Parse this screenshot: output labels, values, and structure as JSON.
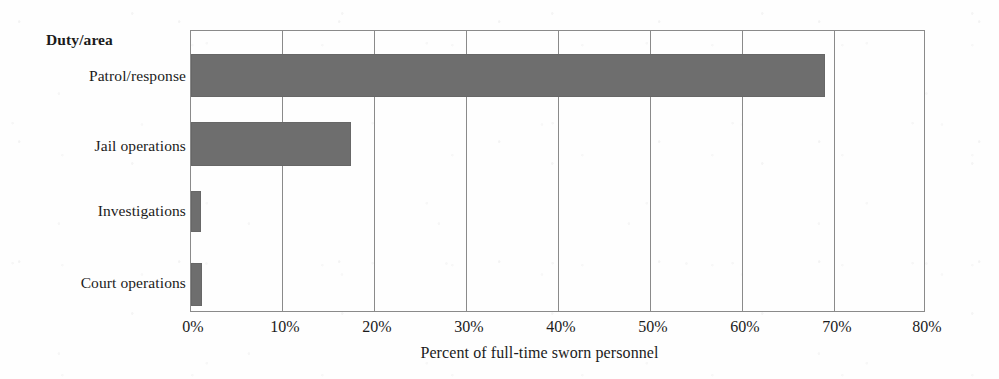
{
  "chart_data": {
    "type": "bar",
    "orientation": "horizontal",
    "title": "",
    "category_axis_label": "Duty/area",
    "xlabel": "Percent of full-time sworn personnel",
    "ylabel": "",
    "categories": [
      "Patrol/response",
      "Jail operations",
      "Investigations",
      "Court operations"
    ],
    "values": [
      69.0,
      17.4,
      1.1,
      1.2
    ],
    "value_suffix": "%",
    "xlim": [
      0,
      80
    ],
    "xticks": [
      0,
      10,
      20,
      30,
      40,
      50,
      60,
      70,
      80
    ],
    "xtick_labels": [
      "0%",
      "10%",
      "20%",
      "30%",
      "40%",
      "50%",
      "60%",
      "70%",
      "80%"
    ],
    "grid": "vertical",
    "legend": "none",
    "bar_color": "#6e6e6e",
    "axis_color": "#8a8a8a",
    "background_color": "#fefefe"
  },
  "chart": {
    "axis_header": "Duty/area",
    "x_title": "Percent of full-time sworn personnel",
    "bars": [
      {
        "label": "Patrol/response",
        "value": 69.0
      },
      {
        "label": "Jail operations",
        "value": 17.4
      },
      {
        "label": "Investigations",
        "value": 1.1
      },
      {
        "label": "Court operations",
        "value": 1.2
      }
    ],
    "ticks": [
      {
        "label": "0%",
        "value": 0
      },
      {
        "label": "10%",
        "value": 10
      },
      {
        "label": "20%",
        "value": 20
      },
      {
        "label": "30%",
        "value": 30
      },
      {
        "label": "40%",
        "value": 40
      },
      {
        "label": "50%",
        "value": 50
      },
      {
        "label": "60%",
        "value": 60
      },
      {
        "label": "70%",
        "value": 70
      },
      {
        "label": "80%",
        "value": 80
      }
    ]
  }
}
